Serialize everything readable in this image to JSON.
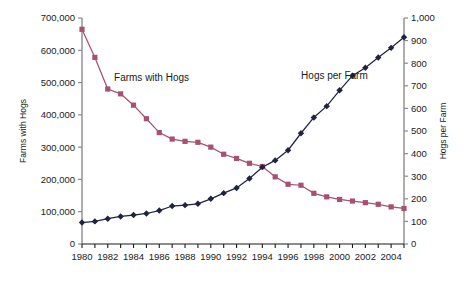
{
  "chart_data": {
    "type": "line",
    "title": "",
    "xlabel": "",
    "grid": false,
    "legend_position": "inline-annotation",
    "x": [
      1980,
      1981,
      1982,
      1983,
      1984,
      1985,
      1986,
      1987,
      1988,
      1989,
      1990,
      1991,
      1992,
      1993,
      1994,
      1995,
      1996,
      1997,
      1998,
      1999,
      2000,
      2001,
      2002,
      2003,
      2004,
      2005
    ],
    "x_tick_labels": [
      "1980",
      "",
      "1982",
      "",
      "1984",
      "",
      "1986",
      "",
      "1988",
      "",
      "1990",
      "",
      "1992",
      "",
      "1994",
      "",
      "1996",
      "",
      "1998",
      "",
      "2000",
      "",
      "2002",
      "",
      "2004",
      ""
    ],
    "xlim": [
      1980,
      2005
    ],
    "axes": {
      "left": {
        "label": "Farms with Hogs",
        "ylim": [
          0,
          700000
        ],
        "ticks": [
          0,
          100000,
          200000,
          300000,
          400000,
          500000,
          600000,
          700000
        ],
        "tick_labels": [
          "0",
          "100,000",
          "200,000",
          "300,000",
          "400,000",
          "500,000",
          "600,000",
          "700,000"
        ]
      },
      "right": {
        "label": "Hogs per Farm",
        "ylim": [
          0,
          1000
        ],
        "ticks": [
          0,
          100,
          200,
          300,
          400,
          500,
          600,
          700,
          800,
          900,
          1000
        ],
        "tick_labels": [
          "0",
          "100",
          "200",
          "300",
          "400",
          "500",
          "600",
          "700",
          "800",
          "900",
          "1,000"
        ]
      }
    },
    "series": [
      {
        "name": "Farms with Hogs",
        "axis": "left",
        "color": "#a8506f",
        "marker": "square",
        "annotation": "Farms with Hogs",
        "annotation_x": 1985.4,
        "annotation_y": 505000,
        "values": [
          665000,
          578000,
          480000,
          465000,
          430000,
          388000,
          345000,
          325000,
          318000,
          315000,
          300000,
          278000,
          265000,
          250000,
          240000,
          208000,
          185000,
          182000,
          157000,
          146000,
          138000,
          133000,
          128000,
          123000,
          115000,
          110000
        ]
      },
      {
        "name": "Hogs per Farm",
        "axis": "right",
        "color": "#1f2340",
        "marker": "diamond",
        "annotation": "Hogs per Farm",
        "annotation_x": 1999.6,
        "annotation_y": 730,
        "values": [
          95,
          100,
          112,
          122,
          128,
          135,
          148,
          168,
          172,
          178,
          200,
          225,
          248,
          290,
          340,
          370,
          415,
          490,
          560,
          610,
          680,
          745,
          780,
          825,
          868,
          915
        ]
      }
    ]
  },
  "geometry": {
    "plot_left": 82,
    "plot_right": 404,
    "plot_top": 18,
    "plot_bottom": 244
  }
}
